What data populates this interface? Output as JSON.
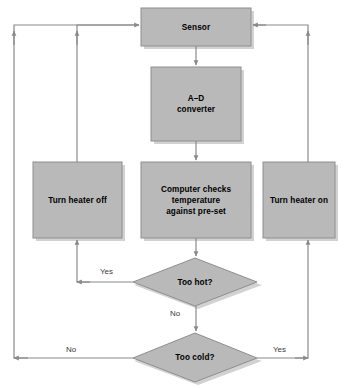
{
  "diagram": {
    "type": "flowchart",
    "colors": {
      "node_fill": "#b9b9b9",
      "node_stroke": "#8e8e8e",
      "node_shadow": "#cfcfcf",
      "line": "#8a8a8a",
      "text": "#000000",
      "label_text": "#3a3a3a",
      "background": "#ffffff"
    },
    "nodes": [
      {
        "id": "sensor",
        "shape": "rectangle",
        "label": "Sensor",
        "lines": [
          "Sensor"
        ],
        "x": 141,
        "y": 8,
        "width": 110,
        "height": 38
      },
      {
        "id": "ad-converter",
        "shape": "rectangle",
        "label": "A–D converter",
        "lines": [
          "A–D",
          "converter"
        ],
        "x": 151,
        "y": 67,
        "width": 90,
        "height": 74
      },
      {
        "id": "computer-checks",
        "shape": "rectangle",
        "label": "Computer checks temperature against pre-set",
        "lines": [
          "Computer checks",
          "temperature",
          "against pre-set"
        ],
        "x": 141,
        "y": 162,
        "width": 110,
        "height": 76
      },
      {
        "id": "turn-heater-off",
        "shape": "rectangle",
        "label": "Turn heater off",
        "lines": [
          "Turn heater off"
        ],
        "x": 33,
        "y": 162,
        "width": 89,
        "height": 76
      },
      {
        "id": "turn-heater-on",
        "shape": "rectangle",
        "label": "Turn heater on",
        "lines": [
          "Turn heater on"
        ],
        "x": 263,
        "y": 162,
        "width": 72,
        "height": 76
      },
      {
        "id": "too-hot",
        "shape": "diamond",
        "label": "Too hot?",
        "lines": [
          "Too hot?"
        ],
        "x": 133,
        "y": 258,
        "width": 124,
        "height": 48
      },
      {
        "id": "too-cold",
        "shape": "diamond",
        "label": "Too cold?",
        "lines": [
          "Too cold?"
        ],
        "x": 133,
        "y": 333,
        "width": 124,
        "height": 49
      }
    ],
    "edges": [
      {
        "id": "sensor-to-ad",
        "from": "sensor",
        "to": "ad-converter",
        "label": ""
      },
      {
        "id": "ad-to-computer",
        "from": "ad-converter",
        "to": "computer-checks",
        "label": ""
      },
      {
        "id": "computer-to-too-hot",
        "from": "computer-checks",
        "to": "too-hot",
        "label": ""
      },
      {
        "id": "too-hot-yes",
        "from": "too-hot",
        "to": "turn-heater-off",
        "label": "Yes"
      },
      {
        "id": "too-hot-no",
        "from": "too-hot",
        "to": "too-cold",
        "label": "No"
      },
      {
        "id": "too-cold-no",
        "from": "too-cold",
        "to": "sensor",
        "label": "No"
      },
      {
        "id": "too-cold-yes",
        "from": "too-cold",
        "to": "turn-heater-on",
        "label": "Yes"
      },
      {
        "id": "heater-off-to-sensor",
        "from": "turn-heater-off",
        "to": "sensor",
        "label": ""
      },
      {
        "id": "heater-on-to-sensor",
        "from": "turn-heater-on",
        "to": "sensor",
        "label": ""
      }
    ],
    "edge_labels": [
      {
        "id": "label-too-hot-yes",
        "text": "Yes",
        "x": 100,
        "y": 267
      },
      {
        "id": "label-too-hot-no",
        "text": "No",
        "x": 170,
        "y": 309
      },
      {
        "id": "label-too-cold-no",
        "text": "No",
        "x": 66,
        "y": 345
      },
      {
        "id": "label-too-cold-yes",
        "text": "Yes",
        "x": 273,
        "y": 345
      }
    ]
  }
}
